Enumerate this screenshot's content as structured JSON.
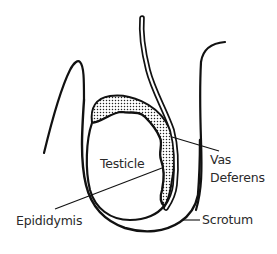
{
  "diagram": {
    "colors": {
      "stroke": "#111111",
      "text": "#2a2a2a",
      "background": "#ffffff",
      "stipple": "#222222"
    },
    "labels": {
      "testicle": "Testicle",
      "vas_line1": "Vas",
      "vas_line2": "Deferens",
      "epididymis": "Epididymis",
      "scrotum": "Scrotum"
    }
  }
}
